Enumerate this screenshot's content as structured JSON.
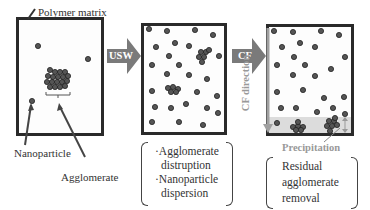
{
  "diagram": {
    "panels": [
      {
        "id": "initial",
        "labels": {
          "matrix": "Polymer matrix",
          "nanoparticle": "Nanoparticle",
          "agglomerate": "Agglomerate"
        }
      },
      {
        "id": "after-usw",
        "notes": [
          "·Agglomerate",
          "distruption",
          "·Nanoparticle",
          "dispersion"
        ]
      },
      {
        "id": "after-cf",
        "cf_direction_label": "CF direction",
        "precipitation_label": "Precipitation",
        "notes": [
          "Residual",
          "agglomerate",
          "removal"
        ]
      }
    ],
    "arrows": [
      {
        "label": "USW",
        "color": "#7a7a7a"
      },
      {
        "label": "CF",
        "color": "#7a7a7a"
      }
    ],
    "colors": {
      "particle": "#555555",
      "particle_stroke": "#222222",
      "frame": "#2a2a2a",
      "cf_arrow": "#a0a0a0",
      "precip_band": "#dcdcdc"
    }
  }
}
